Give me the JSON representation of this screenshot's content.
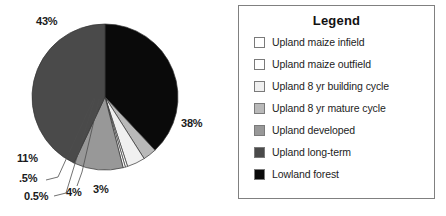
{
  "chart_data": {
    "type": "pie",
    "title": "",
    "legend_title": "Legend",
    "legend_position": "right",
    "grid": false,
    "categories": [
      "Upland maize infield",
      "Upland  maize outfield",
      "Upland 8 yr building cycle",
      "Upland 8 yr mature cycle",
      "Upland developed",
      "Upland long-term",
      "Lowland forest"
    ],
    "values": [
      0.5,
      0.5,
      4,
      3,
      11,
      43,
      38
    ],
    "value_labels": [
      "0.5%",
      ".5%",
      "4%",
      "3%",
      "11%",
      "43%",
      "38%"
    ],
    "colors": [
      "#ffffff",
      "#ffffff",
      "#f0f0f0",
      "#b9b9b9",
      "#989898",
      "#4a4a4a",
      "#0a0a0a"
    ],
    "slice_border": "#333333",
    "units": "percent"
  },
  "pie": {
    "labels": [
      {
        "text": "43%",
        "name": "slice-label-43"
      },
      {
        "text": "38%",
        "name": "slice-label-38"
      },
      {
        "text": "11%",
        "name": "slice-label-11"
      },
      {
        "text": ".5%",
        "name": "slice-label-point5"
      },
      {
        "text": "0.5%",
        "name": "slice-label-0point5"
      },
      {
        "text": "4%",
        "name": "slice-label-4"
      },
      {
        "text": "3%",
        "name": "slice-label-3"
      }
    ]
  },
  "legend": {
    "title": "Legend",
    "items": [
      {
        "label": "Upland maize infield",
        "color": "#ffffff"
      },
      {
        "label": "Upland  maize outfield",
        "color": "#ffffff"
      },
      {
        "label": "Upland 8 yr building cycle",
        "color": "#f0f0f0"
      },
      {
        "label": "Upland 8 yr mature cycle",
        "color": "#b9b9b9"
      },
      {
        "label": "Upland developed",
        "color": "#989898"
      },
      {
        "label": "Upland long-term",
        "color": "#4a4a4a"
      },
      {
        "label": "Lowland forest",
        "color": "#0a0a0a"
      }
    ]
  }
}
